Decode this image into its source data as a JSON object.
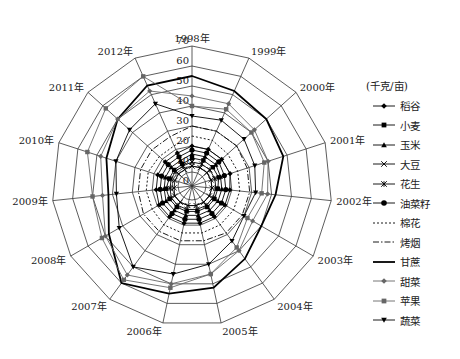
{
  "chart_data": {
    "type": "radar",
    "title": "",
    "unit_label": "(千克/亩)",
    "categories": [
      "1998年",
      "1999年",
      "2000年",
      "2001年",
      "2002年",
      "2003年",
      "2004年",
      "2005年",
      "2006年",
      "2007年",
      "2008年",
      "2009年",
      "2010年",
      "2011年",
      "2012年"
    ],
    "rlim": [
      0,
      70
    ],
    "ticks": [
      0,
      10,
      20,
      30,
      40,
      50,
      60,
      70
    ],
    "tick_labels": [
      "0",
      "10",
      "20",
      "30",
      "40",
      "50",
      "60",
      "70"
    ],
    "series": [
      {
        "name": "稻谷",
        "marker": "diamond",
        "style": "solid",
        "color": "#000000",
        "values": [
          20,
          20,
          20,
          20,
          19,
          19,
          19,
          19,
          19,
          19,
          19,
          18,
          18,
          18,
          18
        ]
      },
      {
        "name": "小麦",
        "marker": "square",
        "style": "solid",
        "color": "#000000",
        "values": [
          14,
          14,
          14,
          14,
          13,
          13,
          13,
          13,
          13,
          13,
          13,
          13,
          12,
          12,
          12
        ]
      },
      {
        "name": "玉米",
        "marker": "triangle",
        "style": "solid",
        "color": "#000000",
        "values": [
          16,
          16,
          16,
          15,
          15,
          15,
          15,
          15,
          15,
          15,
          15,
          14,
          14,
          14,
          14
        ]
      },
      {
        "name": "大豆",
        "marker": "x",
        "style": "solid",
        "color": "#000000",
        "values": [
          10,
          10,
          10,
          10,
          10,
          10,
          10,
          10,
          10,
          10,
          10,
          9,
          9,
          9,
          9
        ]
      },
      {
        "name": "花生",
        "marker": "star",
        "style": "solid",
        "color": "#000000",
        "values": [
          12,
          12,
          12,
          12,
          12,
          12,
          12,
          12,
          12,
          12,
          12,
          11,
          11,
          11,
          11
        ]
      },
      {
        "name": "油菜籽",
        "marker": "circle",
        "style": "solid",
        "color": "#000000",
        "values": [
          18,
          18,
          18,
          17,
          17,
          17,
          17,
          17,
          17,
          17,
          17,
          16,
          16,
          16,
          16
        ]
      },
      {
        "name": "棉花",
        "marker": "none",
        "style": "dotted",
        "color": "#000000",
        "values": [
          25,
          25,
          24,
          24,
          24,
          24,
          24,
          24,
          24,
          24,
          23,
          23,
          23,
          22,
          22
        ]
      },
      {
        "name": "烤烟",
        "marker": "none",
        "style": "dashdot",
        "color": "#000000",
        "values": [
          30,
          30,
          30,
          29,
          29,
          29,
          29,
          28,
          28,
          28,
          28,
          27,
          27,
          27,
          27
        ]
      },
      {
        "name": "甘蔗",
        "marker": "none",
        "style": "solid-thick",
        "color": "#000000",
        "values": [
          55,
          52,
          50,
          48,
          42,
          40,
          45,
          52,
          55,
          60,
          48,
          42,
          45,
          50,
          55
        ]
      },
      {
        "name": "甜菜",
        "marker": "diamond",
        "style": "solid",
        "color": "#666666",
        "values": [
          45,
          45,
          42,
          40,
          38,
          35,
          40,
          45,
          50,
          55,
          50,
          45,
          48,
          50,
          52
        ]
      },
      {
        "name": "苹果",
        "marker": "square",
        "style": "solid",
        "color": "#666666",
        "values": [
          40,
          42,
          40,
          38,
          35,
          32,
          38,
          45,
          52,
          58,
          52,
          50,
          55,
          58,
          60
        ]
      },
      {
        "name": "蔬菜",
        "marker": "triangle-down",
        "style": "solid",
        "color": "#000000",
        "values": [
          35,
          36,
          35,
          33,
          32,
          30,
          34,
          40,
          45,
          50,
          42,
          38,
          40,
          42,
          45
        ]
      }
    ],
    "legend_position": "right",
    "grid": true
  }
}
